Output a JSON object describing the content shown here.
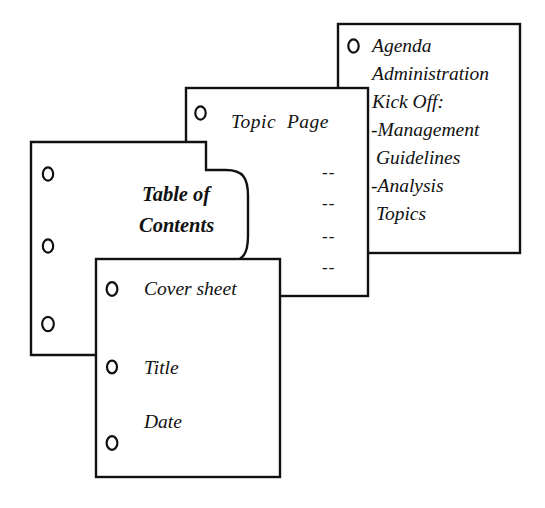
{
  "diagram": {
    "ink_color": "#111111",
    "paper_color": "#ffffff"
  },
  "sheets": {
    "agenda": {
      "name": "Agenda / back page",
      "lines": [
        "Agenda",
        "Administration",
        "Kick Off:",
        "-Management",
        " Guidelines",
        "-Analysis",
        " Topics"
      ],
      "hole_count": 1
    },
    "topic": {
      "name": "Topic Page",
      "title": "Topic  Page",
      "dashes": [
        "--",
        "--",
        "--",
        "--"
      ],
      "hole_count": 1
    },
    "toc": {
      "name": "Table of Contents",
      "title_line1": "Table of",
      "title_line2": "Contents",
      "hole_count": 3
    },
    "cover": {
      "name": "Cover sheet",
      "lines": [
        "Cover sheet",
        "Title",
        "Date"
      ],
      "hole_count": 3
    }
  }
}
